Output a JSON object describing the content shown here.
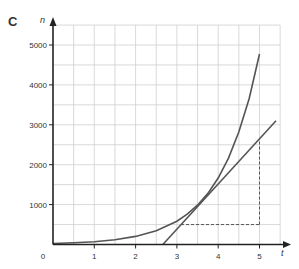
{
  "panel_label": "C",
  "chart_data": {
    "type": "line",
    "title": "",
    "xlabel": "t",
    "ylabel": "n",
    "xlim": [
      0,
      5.5
    ],
    "ylim": [
      0,
      5500
    ],
    "x_ticks": [
      0,
      1,
      2,
      3,
      4,
      5
    ],
    "y_ticks": [
      1000,
      2000,
      3000,
      4000,
      5000
    ],
    "x_tick_labels": [
      "0",
      "1",
      "2",
      "3",
      "4",
      "5"
    ],
    "y_tick_labels": [
      "1000",
      "2000",
      "3000",
      "4000",
      "5000"
    ],
    "grid": {
      "on": true,
      "x_step": 0.5,
      "y_step": 500
    },
    "legend": null,
    "series": [
      {
        "name": "curve",
        "kind": "exponential",
        "x": [
          0,
          0.5,
          1,
          1.5,
          2,
          2.5,
          3,
          3.25,
          3.5,
          3.75,
          4,
          4.25,
          4.5,
          4.75,
          5
        ],
        "values": [
          25,
          42,
          71,
          121,
          204,
          345,
          584,
          760,
          985,
          1280,
          1667,
          2165,
          2816,
          3660,
          4775
        ]
      },
      {
        "name": "tangent line",
        "kind": "straight",
        "x": [
          2.66,
          5.4
        ],
        "values": [
          0,
          3100
        ]
      }
    ],
    "annotations": [
      {
        "type": "dashed-horizontal",
        "from": [
          3.1,
          500
        ],
        "to": [
          5,
          500
        ]
      },
      {
        "type": "dashed-vertical",
        "from": [
          5,
          500
        ],
        "to": [
          5,
          2650
        ]
      }
    ]
  }
}
